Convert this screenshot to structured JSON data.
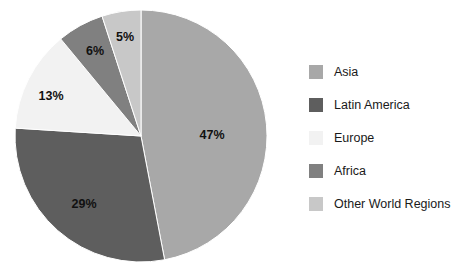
{
  "chart_data": {
    "type": "pie",
    "title": "",
    "subtitle": "",
    "xlabel": "",
    "ylabel": "",
    "grid": false,
    "legend_position": "right",
    "start_angle_deg": 0,
    "direction": "clockwise",
    "center": {
      "cx": 141,
      "cy": 136,
      "r": 126
    },
    "categories": [
      "Asia",
      "Latin America",
      "Europe",
      "Africa",
      "Other World Regions"
    ],
    "values": [
      47,
      29,
      13,
      6,
      5
    ],
    "value_unit": "%",
    "data_labels": [
      "47%",
      "29%",
      "13%",
      "6%",
      "5%"
    ],
    "colors": [
      "#a8a8a8",
      "#5e5e5e",
      "#f2f2f2",
      "#808080",
      "#c8c8c8"
    ],
    "slices": [
      {
        "label": "Asia",
        "value": 47,
        "data_label": "47%",
        "color": "#a8a8a8",
        "label_x": 212,
        "label_y": 136
      },
      {
        "label": "Latin America",
        "value": 29,
        "data_label": "29%",
        "color": "#5e5e5e",
        "label_x": 84,
        "label_y": 205
      },
      {
        "label": "Europe",
        "value": 13,
        "data_label": "13%",
        "color": "#f2f2f2",
        "label_x": 51,
        "label_y": 97
      },
      {
        "label": "Africa",
        "value": 6,
        "data_label": "6%",
        "color": "#808080",
        "label_x": 95,
        "label_y": 52
      },
      {
        "label": "Other World Regions",
        "value": 5,
        "data_label": "5%",
        "color": "#c8c8c8",
        "label_x": 125,
        "label_y": 38
      }
    ]
  },
  "legend": {
    "items": [
      {
        "label": "Asia",
        "color": "#a8a8a8"
      },
      {
        "label": "Latin America",
        "color": "#5e5e5e"
      },
      {
        "label": "Europe",
        "color": "#f2f2f2"
      },
      {
        "label": "Africa",
        "color": "#808080"
      },
      {
        "label": "Other World Regions",
        "color": "#c8c8c8"
      }
    ]
  }
}
